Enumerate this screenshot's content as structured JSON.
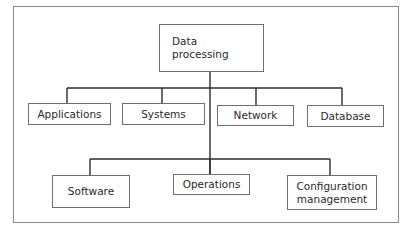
{
  "diagram": {
    "type": "org-chart",
    "colors": {
      "line": "#2b2b2b",
      "box_border": "#6e6e6e",
      "frame": "#8a8a8a",
      "text": "#2a2a2a"
    },
    "root": {
      "label": "Data\nprocessing",
      "x": 159,
      "y": 24,
      "w": 105,
      "h": 48,
      "align": "left"
    },
    "branch_y_1": 88,
    "branch_y_2": 159,
    "trunk_x": 210,
    "level1": [
      {
        "label": "Applications",
        "x": 28,
        "y": 103,
        "w": 83,
        "h": 22,
        "cx": 67
      },
      {
        "label": "Systems",
        "x": 122,
        "y": 103,
        "w": 83,
        "h": 22,
        "cx": 162
      },
      {
        "label": "Network",
        "x": 217,
        "y": 105,
        "w": 77,
        "h": 21,
        "cx": 256
      },
      {
        "label": "Database",
        "x": 307,
        "y": 105,
        "w": 77,
        "h": 22,
        "cx": 342
      }
    ],
    "level2": [
      {
        "label": "Software",
        "x": 52,
        "y": 175,
        "w": 78,
        "h": 33,
        "cx": 90
      },
      {
        "label": "Operations",
        "x": 173,
        "y": 174,
        "w": 77,
        "h": 21,
        "cx": 210
      },
      {
        "label": "Configuration\nmanagement",
        "x": 287,
        "y": 175,
        "w": 90,
        "h": 35,
        "cx": 330
      }
    ],
    "frame": {
      "x": 13,
      "y": 6,
      "w": 386,
      "h": 217
    }
  }
}
